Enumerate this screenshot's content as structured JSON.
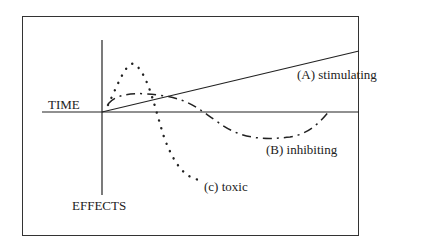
{
  "diagram": {
    "x_axis_label": "TIME",
    "y_axis_label": "EFFECTS",
    "curves": [
      {
        "id": "A",
        "label": "(A) stimulating",
        "style": "solid"
      },
      {
        "id": "B",
        "label": "(B) inhibiting",
        "style": "dash-dot"
      },
      {
        "id": "C",
        "label": "(c) toxic",
        "style": "dotted"
      }
    ]
  }
}
